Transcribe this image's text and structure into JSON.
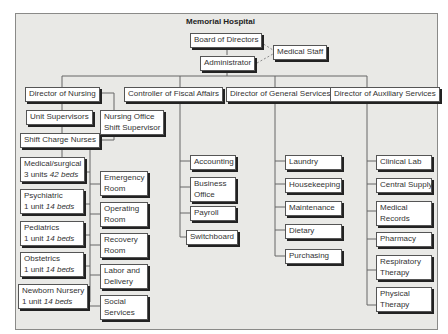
{
  "title": "Memorial Hospital",
  "top": {
    "board": "Board of Directors",
    "admin": "Administrator",
    "medical_staff": "Medical Staff"
  },
  "directors": {
    "nursing": "Director of Nursing",
    "fiscal": "Controller of Fiscal Affairs",
    "general": "Director of General Services",
    "auxiliary": "Director of Auxiliary Services"
  },
  "nursing": {
    "unit_supervisors": "Unit Supervisors",
    "office_1": "Nursing Office",
    "office_2": "Shift Supervisor",
    "shift_charge": "Shift Charge Nurses",
    "units": [
      {
        "name": "Medical/surgical",
        "count": "3 units",
        "beds": "42 beds"
      },
      {
        "name": "Psychiatric",
        "count": "1 unit",
        "beds": "14 beds"
      },
      {
        "name": "Pediatrics",
        "count": "1 unit",
        "beds": "14 beds"
      },
      {
        "name": "Obstetrics",
        "count": "1 unit",
        "beds": "14 beds"
      },
      {
        "name": "Newborn Nursery",
        "count": "1 unit",
        "beds": "14 beds"
      }
    ],
    "services": [
      {
        "l1": "Emergency",
        "l2": "Room"
      },
      {
        "l1": "Operating",
        "l2": "Room"
      },
      {
        "l1": "Recovery",
        "l2": "Room"
      },
      {
        "l1": "Labor and",
        "l2": "Delivery"
      },
      {
        "l1": "Social",
        "l2": "Services"
      }
    ]
  },
  "fiscal": [
    {
      "l1": "Accounting"
    },
    {
      "l1": "Business",
      "l2": "Office"
    },
    {
      "l1": "Payroll"
    },
    {
      "l1": "Switchboard"
    }
  ],
  "general": [
    "Laundry",
    "Housekeeping",
    "Maintenance",
    "Dietary",
    "Purchasing"
  ],
  "auxiliary": [
    {
      "l1": "Clinical Lab"
    },
    {
      "l1": "Central Supply"
    },
    {
      "l1": "Medical",
      "l2": "Records"
    },
    {
      "l1": "Pharmacy"
    },
    {
      "l1": "Respiratory",
      "l2": "Therapy"
    },
    {
      "l1": "Physical",
      "l2": "Therapy"
    }
  ]
}
